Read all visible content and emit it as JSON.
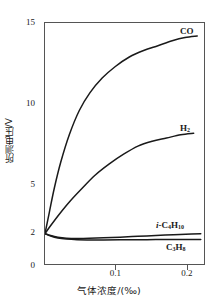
{
  "chart_data": {
    "type": "line",
    "title": "",
    "xlabel": "气体浓度/(‰)",
    "ylabel": "所测电压/V",
    "xlim": [
      0,
      0.2253
    ],
    "ylim": [
      0,
      15
    ],
    "xticks": [
      0.1,
      0.2
    ],
    "xtick_labels": [
      "0.1",
      "0.2"
    ],
    "yticks": [
      0,
      2,
      5,
      10,
      15
    ],
    "ytick_labels": [
      "0",
      "2",
      "5",
      "10",
      "15"
    ],
    "grid": false,
    "legend_position": "inline-right-of-curve-ends",
    "series": [
      {
        "name": "CO",
        "label": "CO",
        "color": "#1a1a1a",
        "x": [
          0,
          0.006,
          0.013,
          0.022,
          0.034,
          0.048,
          0.063,
          0.08,
          0.098,
          0.118,
          0.138,
          0.158,
          0.178,
          0.196,
          0.213
        ],
        "y": [
          2.0,
          3.3,
          4.8,
          6.4,
          8.1,
          9.6,
          10.7,
          11.6,
          12.3,
          12.9,
          13.3,
          13.6,
          13.9,
          14.1,
          14.2
        ]
      },
      {
        "name": "H2",
        "label": "H₂",
        "color": "#1a1a1a",
        "x": [
          0,
          0.008,
          0.02,
          0.035,
          0.052,
          0.07,
          0.09,
          0.11,
          0.13,
          0.15,
          0.17,
          0.19,
          0.208
        ],
        "y": [
          2.0,
          2.5,
          3.2,
          4.0,
          4.8,
          5.6,
          6.3,
          6.9,
          7.4,
          7.7,
          7.9,
          8.1,
          8.2
        ]
      },
      {
        "name": "i-C4H10",
        "label": "i-C₄H₁₀",
        "color": "#1a1a1a",
        "x": [
          0,
          0.008,
          0.018,
          0.03,
          0.045,
          0.062,
          0.082,
          0.105,
          0.13,
          0.155,
          0.18,
          0.205,
          0.218
        ],
        "y": [
          2.0,
          1.88,
          1.78,
          1.72,
          1.7,
          1.71,
          1.74,
          1.78,
          1.83,
          1.88,
          1.93,
          1.97,
          1.99
        ]
      },
      {
        "name": "C3H8",
        "label": "C₃H₈",
        "color": "#1a1a1a",
        "x": [
          0,
          0.008,
          0.018,
          0.03,
          0.045,
          0.062,
          0.082,
          0.105,
          0.13,
          0.155,
          0.18,
          0.205,
          0.218
        ],
        "y": [
          2.0,
          1.85,
          1.73,
          1.66,
          1.62,
          1.61,
          1.61,
          1.62,
          1.62,
          1.63,
          1.63,
          1.64,
          1.64
        ]
      }
    ]
  }
}
